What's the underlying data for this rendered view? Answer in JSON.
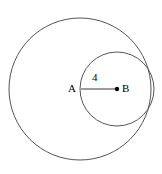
{
  "figure": {
    "type": "geometry-diagram",
    "background_color": "#ffffff",
    "stroke_color": "#555555",
    "label_color": "#000000",
    "outer_circle": {
      "name": "outer-circle",
      "center_x": 80,
      "center_y": 89,
      "radius": 71
    },
    "inner_circle": {
      "name": "inner-circle",
      "center_x": 117,
      "center_y": 89,
      "radius": 37
    },
    "segment": {
      "name": "segment-ab",
      "x1": 81,
      "y1": 89,
      "x2": 117,
      "y2": 89
    },
    "point_b_dot": {
      "cx": 117,
      "cy": 89,
      "r": 2.2
    },
    "labels": {
      "point_a": "A",
      "point_b": "B",
      "segment_length": "4"
    }
  }
}
